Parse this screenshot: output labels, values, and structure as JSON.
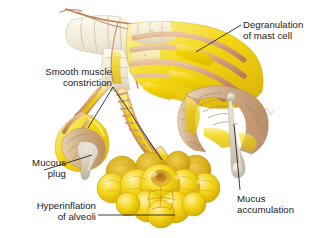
{
  "figure": {
    "background_color": "#ffffff",
    "width": 324,
    "height": 238,
    "signature": "Netter"
  },
  "labels": {
    "degranulation": "Degranulation\nof mast cell",
    "smooth_muscle": "Smooth muscle\nconstriction",
    "mucous_plug": "Mucous\nplug",
    "hyperinflation": "Hyperinflation\nof alveoli",
    "mucus_accumulation": "Mucus\naccumulation"
  },
  "palette": {
    "background": "#ffffff",
    "text": "#1a1a1a",
    "leader_line": "#1a1a1a",
    "bright_yellow": "#f2d200",
    "deep_yellow": "#e8c400",
    "pale_yellow": "#f7e67a",
    "muscle_band": "#d9a882",
    "muscle_band_dark": "#c08d63",
    "cartilage": "#f0ead8",
    "cartilage_shadow": "#ddd4bc",
    "mucosa_tan": "#cba884",
    "mucosa_light": "#e2cbb0",
    "mucus_gray": "#d8d2c4",
    "vessel_brown": "#b5754a"
  },
  "structures": [
    {
      "name": "trachea-bronchus-trunk",
      "description": "Cartilage-ringed airway trunk entering from upper left"
    },
    {
      "name": "main-bronchus-cutaway",
      "description": "Large bronchus with constricting smooth muscle bands and cut-away mucosa"
    },
    {
      "name": "bronchiole-left",
      "description": "Narrowed bronchiole terminating in a cut-away mucous plug"
    },
    {
      "name": "bronchiole-middle",
      "description": "Constricted banded bronchiole leading to alveolar cluster"
    },
    {
      "name": "alveolar-cluster",
      "description": "Hyperinflated grape-like cluster of alveoli"
    },
    {
      "name": "mucus-strand",
      "description": "Mucus accumulation hanging within the bronchial lumen"
    }
  ]
}
